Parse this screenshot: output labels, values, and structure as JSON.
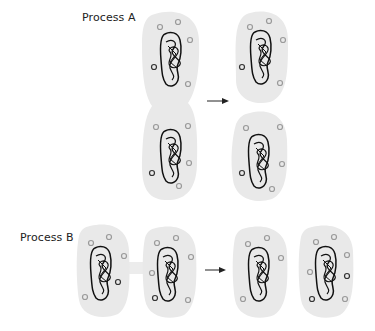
{
  "process_a": {
    "label": "Process A",
    "description": "Single cell pinches in the middle and separates into two daughter cells",
    "arrow": "right-arrow"
  },
  "process_b": {
    "label": "Process B",
    "description": "Two cells joined by a bridge separate into two independent cells",
    "arrow": "right-arrow"
  },
  "colors": {
    "cell_fill": "#e9e9e9",
    "nucleoid_stroke": "#111111",
    "granule_light": "#9a9a9a",
    "granule_dark": "#222222",
    "arrow": "#222222",
    "label_text": "#222222"
  },
  "icons": {
    "cell": "rounded-cell-shape",
    "nucleoid": "tangled-loop",
    "granule": "small-circle",
    "arrow": "right-arrow"
  }
}
